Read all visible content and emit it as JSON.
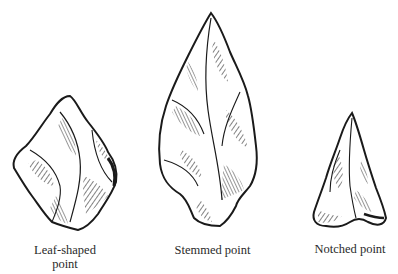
{
  "figure": {
    "items": [
      {
        "id": "leaf",
        "label_line1": "Leaf-shaped",
        "label_line2": "point"
      },
      {
        "id": "stemmed",
        "label_line1": "Stemmed point"
      },
      {
        "id": "notched",
        "label_line1": "Notched point"
      }
    ],
    "colors": {
      "ink": "#1a1a1a",
      "paper": "#ffffff",
      "label": "#2a2a2a"
    }
  }
}
